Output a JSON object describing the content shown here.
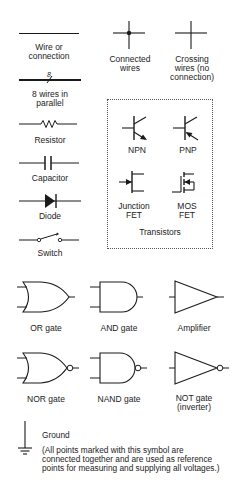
{
  "symbols": {
    "wire": {
      "label": "Wire or connection",
      "lines": [
        "Wire or",
        "connection"
      ]
    },
    "bus": {
      "label": "8 wires in parallel",
      "lines": [
        "8 wires in",
        "parallel"
      ],
      "count_mark": "8"
    },
    "connected": {
      "label": "Connected wires",
      "lines": [
        "Connected",
        "wires"
      ]
    },
    "crossing": {
      "label": "Crossing wires (no connection)",
      "lines": [
        "Crossing",
        "wires (no",
        "connection)"
      ]
    },
    "resistor": {
      "label": "Resistor"
    },
    "capacitor": {
      "label": "Capacitor"
    },
    "diode": {
      "label": "Diode"
    },
    "switch": {
      "label": "Switch"
    }
  },
  "transistors": {
    "group_label": "Transistors",
    "npn": {
      "label": "NPN"
    },
    "pnp": {
      "label": "PNP"
    },
    "jfet": {
      "label": "Junction FET",
      "lines": [
        "Junction",
        "FET"
      ]
    },
    "mosfet": {
      "label": "MOS FET",
      "lines": [
        "MOS",
        "FET"
      ]
    }
  },
  "gates": {
    "or": {
      "label": "OR gate"
    },
    "and": {
      "label": "AND gate"
    },
    "amplifier": {
      "label": "Amplifier"
    },
    "nor": {
      "label": "NOR gate"
    },
    "nand": {
      "label": "NAND gate"
    },
    "not": {
      "label": "NOT gate (inverter)",
      "lines": [
        "NOT gate",
        "(inverter)"
      ]
    }
  },
  "ground": {
    "label": "Ground",
    "note_lines": [
      "(All points marked with this symbol are",
      "connected together and are used as reference",
      "points for measuring and supplying all voltages.)"
    ]
  },
  "colors": {
    "ink": "#1a1a1a",
    "background": "#ffffff"
  }
}
